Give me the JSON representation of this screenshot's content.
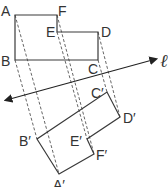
{
  "diagram": {
    "type": "geometry-reflection",
    "line_label": "ℓ",
    "original_vertices": {
      "A": {
        "label": "A",
        "x": 15,
        "y": 15
      },
      "F": {
        "label": "F",
        "x": 57,
        "y": 15
      },
      "E": {
        "label": "E",
        "x": 57,
        "y": 32
      },
      "D": {
        "label": "D",
        "x": 98,
        "y": 32
      },
      "C": {
        "label": "C",
        "x": 98,
        "y": 60
      },
      "B": {
        "label": "B",
        "x": 15,
        "y": 60
      }
    },
    "image_vertices": {
      "A'": {
        "label": "A′",
        "x": 59,
        "y": 174
      },
      "F'": {
        "label": "F′",
        "x": 94,
        "y": 154
      },
      "E'": {
        "label": "E′",
        "x": 87,
        "y": 139
      },
      "D'": {
        "label": "D′",
        "x": 120,
        "y": 117
      },
      "C'": {
        "label": "C′",
        "x": 107,
        "y": 92
      },
      "B'": {
        "label": "B′",
        "x": 37,
        "y": 139
      }
    },
    "labels": {
      "A": "A",
      "B": "B",
      "C": "C",
      "D": "D",
      "E": "E",
      "F": "F",
      "A_prime": "A′",
      "B_prime": "B′",
      "C_prime": "C′",
      "D_prime": "D′",
      "E_prime": "E′",
      "F_prime": "F′",
      "line": "ℓ"
    }
  }
}
